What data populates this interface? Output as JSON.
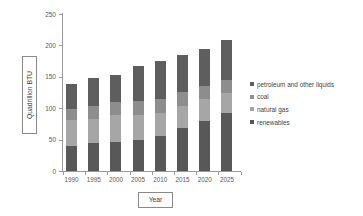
{
  "chart_data": {
    "type": "bar",
    "subtype": "stacked-column",
    "title": "",
    "xlabel": "Year",
    "ylabel": "Quadrillion BTU",
    "categories": [
      "1990",
      "1995",
      "2000",
      "2005",
      "2010",
      "2015",
      "2020",
      "2025"
    ],
    "ylim": [
      0,
      250
    ],
    "yticks": [
      0,
      50,
      100,
      150,
      200,
      250
    ],
    "ytick_labels": [
      "0",
      "50",
      "100",
      "150",
      "200",
      "250"
    ],
    "grid": false,
    "legend_position": "right",
    "series": [
      {
        "name": "renewables",
        "color": "#585858",
        "values": [
          40,
          45,
          46,
          50,
          55,
          69,
          79,
          93
        ]
      },
      {
        "name": "natural gas",
        "color": "#a6a6a6",
        "values": [
          41,
          38,
          43,
          40,
          38,
          34,
          35,
          32
        ]
      },
      {
        "name": "coal",
        "color": "#8d8d8d",
        "values": [
          18,
          20,
          21,
          22,
          22,
          23,
          22,
          20
        ]
      },
      {
        "name": "petroleum and other liquids",
        "color": "#5e5e5e",
        "values": [
          40,
          45,
          43,
          56,
          60,
          59,
          59,
          63
        ]
      }
    ],
    "totals": [
      139,
      148,
      153,
      168,
      175,
      185,
      195,
      208
    ],
    "stack_order_bottom_to_top": [
      "renewables",
      "natural gas",
      "coal",
      "petroleum and other liquids"
    ]
  },
  "legend": {
    "items": [
      {
        "label": "petroleum and other liquids",
        "color": "#5e5e5e"
      },
      {
        "label": "coal",
        "color": "#8d8d8d"
      },
      {
        "label": "natural gas",
        "color": "#a6a6a6"
      },
      {
        "label": "renewables",
        "color": "#585858"
      }
    ]
  },
  "axes": {
    "y_title": "Quadrillion BTU",
    "x_title": "Year"
  },
  "colors": {
    "axis": "#9a9a9a",
    "text": "#3f3f3f",
    "background": "#ffffff"
  }
}
